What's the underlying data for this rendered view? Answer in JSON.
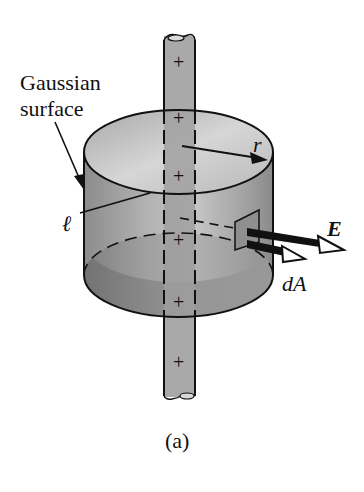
{
  "figure": {
    "caption": "(a)",
    "labels": {
      "gaussian_surface": "Gaussian\nsurface",
      "gaussian_line1": "Gaussian",
      "gaussian_line2": "surface",
      "radius": "r",
      "length": "ℓ",
      "field": "E",
      "area_element": "dA"
    },
    "charge_symbol": "+",
    "charge_count": 6,
    "colors": {
      "rod": "#a8a8a8",
      "cylinder_side": "#9a9a9a",
      "cylinder_bottom": "#7c7c7c",
      "cylinder_top_inner": "#c8c8c8",
      "outline": "#111111",
      "background": "#ffffff"
    }
  }
}
